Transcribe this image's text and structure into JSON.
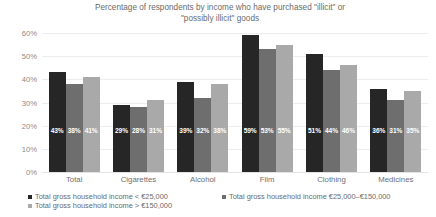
{
  "chart_data": {
    "type": "bar",
    "title": "Percentage of respondents by income who have purchased \"illicit\" or \"possibly illicit\" goods",
    "title_line1": "Percentage of respondents by income who have purchased \"illicit\" or",
    "title_line2": "\"possibly illicit\" goods",
    "xlabel": "",
    "ylabel": "",
    "ylim": [
      0,
      60
    ],
    "ytick_labels": [
      "0%",
      "10%",
      "20%",
      "30%",
      "40%",
      "50%",
      "60%"
    ],
    "ytick_values": [
      0,
      10,
      20,
      30,
      40,
      50,
      60
    ],
    "grid": true,
    "legend_position": "bottom",
    "categories": [
      "Total",
      "Cigarettes",
      "Alcohol",
      "Film",
      "Clothing",
      "Medicines"
    ],
    "series": [
      {
        "name": "Total gross household income < €25,000",
        "color": "#262626",
        "values": [
          43,
          29,
          39,
          59,
          51,
          36
        ],
        "labels": [
          "43%",
          "29%",
          "39%",
          "59%",
          "51%",
          "36%"
        ]
      },
      {
        "name": "Total gross household income €25,000–€150,000",
        "color": "#6e6e6e",
        "values": [
          38,
          28,
          32,
          53,
          44,
          31
        ],
        "labels": [
          "38%",
          "28%",
          "32%",
          "53%",
          "44%",
          "31%"
        ]
      },
      {
        "name": "Total gross household income > €150,000",
        "color": "#a9a9a9",
        "values": [
          41,
          31,
          38,
          55,
          46,
          35
        ],
        "labels": [
          "41%",
          "31%",
          "38%",
          "55%",
          "46%",
          "35%"
        ]
      }
    ]
  }
}
